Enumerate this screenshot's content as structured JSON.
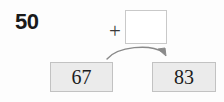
{
  "problem": {
    "target_number": "50",
    "operator": "+",
    "empty_box_value": "",
    "arrow_icon": "curved-arrow-right-icon",
    "plus_icon": "plus-icon"
  },
  "choices": [
    {
      "label": "67"
    },
    {
      "label": "83"
    }
  ],
  "colors": {
    "background": "#fdfdfd",
    "box_fill": "#ebebeb",
    "box_border": "#c2c2c2",
    "empty_box_border": "#c9c9c9",
    "text": "#1c1c1c",
    "arrow": "#8a8a8a"
  }
}
